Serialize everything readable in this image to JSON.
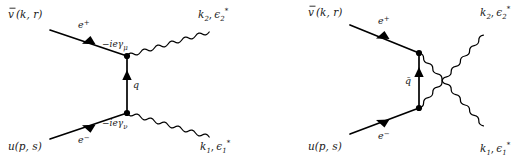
{
  "figure": {
    "background_color": "#ffffff",
    "line_color": "#000000",
    "width": 528,
    "height": 158
  },
  "diagrams": [
    {
      "id": "t-channel",
      "name": "left-diagram",
      "channel_label": "t-channel",
      "propagator": {
        "label": "q",
        "kind": "fermion",
        "arrow_direction": "up"
      },
      "vertices": [
        {
          "id": "top",
          "label": "−ieγ",
          "index": "μ"
        },
        {
          "id": "bottom",
          "label": "−ieγ",
          "index": "ν"
        }
      ],
      "external": {
        "incoming_positron": {
          "spinor": "v̄(k, r)",
          "base": "v",
          "args": "(k, r)",
          "line": "e",
          "charge": "+"
        },
        "incoming_electron": {
          "spinor": "u(p, s)",
          "base": "u",
          "args": "(p, s)",
          "line": "e",
          "charge": "−"
        },
        "outgoing_photon_top": {
          "momentum": "k",
          "momentum_index": "2",
          "polarization": "ϵ",
          "pol_index": "2",
          "pol_star": "*"
        },
        "outgoing_photon_bottom": {
          "momentum": "k",
          "momentum_index": "1",
          "polarization": "ϵ",
          "pol_index": "1",
          "pol_star": "*"
        }
      }
    },
    {
      "id": "u-channel",
      "name": "right-diagram",
      "channel_label": "u-channel (crossed)",
      "propagator": {
        "label": "q̄",
        "kind": "fermion",
        "arrow_direction": "up"
      },
      "vertices": [
        {
          "id": "top",
          "label": "",
          "index": ""
        },
        {
          "id": "bottom",
          "label": "",
          "index": ""
        }
      ],
      "external": {
        "incoming_positron": {
          "spinor": "v̄(k, r)",
          "base": "v",
          "args": "(k, r)",
          "line": "e",
          "charge": "+"
        },
        "incoming_electron": {
          "spinor": "u(p, s)",
          "base": "u",
          "args": "(p, s)",
          "line": "e",
          "charge": "−"
        },
        "outgoing_photon_top": {
          "momentum": "k",
          "momentum_index": "2",
          "polarization": "ϵ",
          "pol_index": "2",
          "pol_star": "*"
        },
        "outgoing_photon_bottom": {
          "momentum": "k",
          "momentum_index": "1",
          "polarization": "ϵ",
          "pol_index": "1",
          "pol_star": "*"
        }
      }
    }
  ]
}
